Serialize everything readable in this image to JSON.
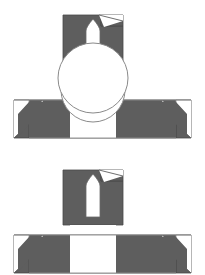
{
  "document": {
    "title": "Emblem Construction Diagram",
    "background_color": "#ffffff",
    "width": 205,
    "height": 275
  },
  "palette": {
    "fill_gray": "#5e5e5e",
    "outline_gray": "#8a8a8a",
    "white": "#ffffff",
    "stroke_dark": "#4a4a4a"
  },
  "figures": [
    {
      "id": "figure-top",
      "label": "Variant A",
      "offset_y": 0,
      "block": {
        "name": "notched-block",
        "x": 63,
        "y": 15,
        "width": 60,
        "height": 55,
        "notch_corner": "top-right",
        "notch_width": 22,
        "notch_depth": 11
      },
      "arch_cutout": {
        "name": "arch-cutout",
        "center_x": 93,
        "top_y": 19,
        "bottom_y": 62,
        "width": 14,
        "apex_height": 12
      },
      "circle": {
        "name": "overlay-circle",
        "center_x": 93,
        "center_y": 90,
        "radius": 32
      },
      "ribbon": {
        "name": "swallowtail-ribbon",
        "left_x": 14,
        "right_x": 191,
        "top_y": 100,
        "bottom_y": 138,
        "tail_depth": 14,
        "tail_inset": 15
      }
    },
    {
      "id": "figure-bottom",
      "label": "Variant B",
      "offset_y": 155,
      "block": {
        "name": "notched-block",
        "x": 63,
        "y": 15,
        "width": 60,
        "height": 55,
        "notch_corner": "top-right",
        "notch_width": 22,
        "notch_depth": 11
      },
      "arch_cutout": {
        "name": "arch-cutout",
        "center_x": 93,
        "top_y": 19,
        "bottom_y": 62,
        "width": 14,
        "apex_height": 12
      },
      "circle": {
        "name": "overlay-circle",
        "center_x": 93,
        "center_y": 78,
        "radius": 35
      },
      "ribbon": {
        "name": "swallowtail-ribbon",
        "left_x": 14,
        "right_x": 191,
        "top_y": 80,
        "bottom_y": 118,
        "tail_depth": 14,
        "tail_inset": 15
      }
    }
  ],
  "chart_data": {
    "type": "diagram",
    "variants": [
      {
        "name": "Variant A",
        "circle_radius": 32,
        "circle_center": [
          93,
          90
        ],
        "ribbon_band": [
          100,
          138
        ],
        "block_rect": [
          63,
          15,
          60,
          55
        ]
      },
      {
        "name": "Variant B",
        "circle_radius": 35,
        "circle_center": [
          93,
          233
        ],
        "ribbon_band": [
          235,
          273
        ],
        "block_rect": [
          63,
          170,
          60,
          55
        ]
      }
    ],
    "elements": [
      "notched-block",
      "arch-cutout",
      "overlay-circle",
      "swallowtail-ribbon"
    ],
    "colors": {
      "fill": "#5e5e5e",
      "outline": "#8a8a8a",
      "background": "#ffffff"
    },
    "legend": [],
    "grid": false
  }
}
